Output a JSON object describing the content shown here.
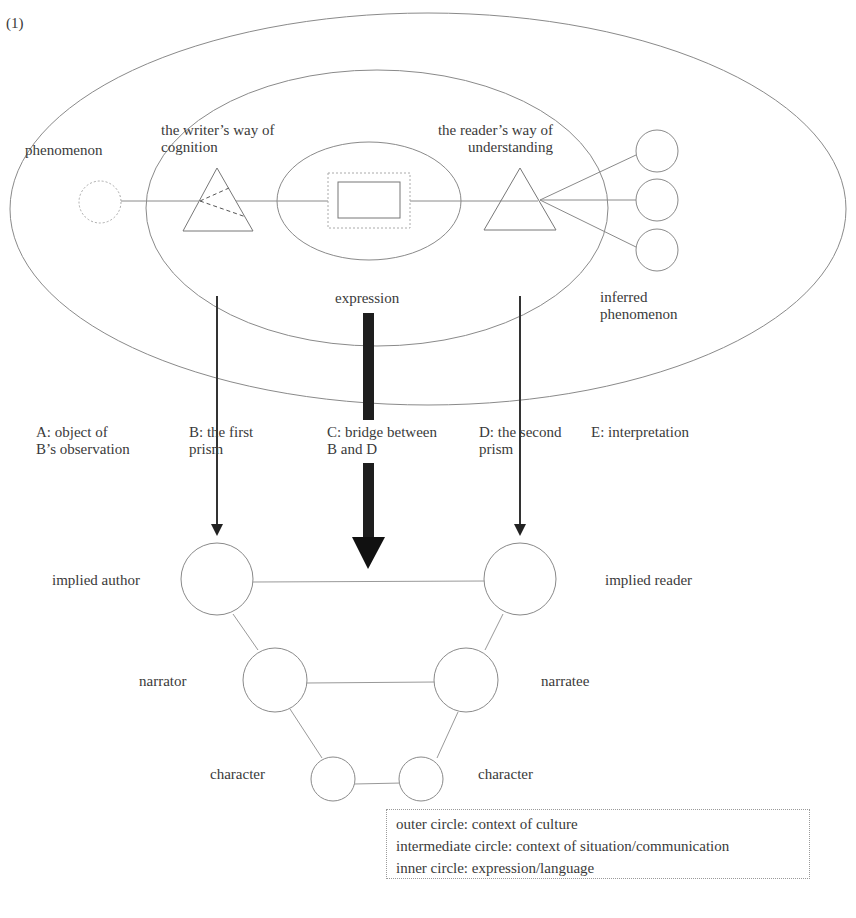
{
  "figure": {
    "number_label": "(1)",
    "top_diagram": {
      "labels": {
        "phenomenon": "phenomenon",
        "writer_way": [
          "the writer’s way of",
          "cognition"
        ],
        "reader_way": [
          "the reader’s way of",
          "understanding"
        ],
        "expression": "expression",
        "inferred": [
          "inferred",
          "phenomenon"
        ]
      },
      "shapes": {
        "outer_circle": "context of culture",
        "intermediate_circle": "context of situation/communication",
        "inner_circle": "expression/language",
        "phenomenon_circle": "dotted",
        "writer_prism": "triangle with dashed refraction lines",
        "reader_prism": "triangle",
        "inferred_phenomena_count": 3
      }
    },
    "roles": [
      {
        "id": "A",
        "lines": [
          "A: object of",
          "B’s observation"
        ]
      },
      {
        "id": "B",
        "lines": [
          "B: the first",
          "prism"
        ]
      },
      {
        "id": "C",
        "lines": [
          "C: bridge between",
          "B and D"
        ]
      },
      {
        "id": "D",
        "lines": [
          "D: the second",
          "prism"
        ]
      },
      {
        "id": "E",
        "lines": [
          "E: interpretation"
        ]
      }
    ],
    "bottom_diagram": {
      "left": [
        "implied author",
        "narrator",
        "character"
      ],
      "right": [
        "implied reader",
        "narratee",
        "character"
      ]
    },
    "legend": [
      "outer circle: context of culture",
      "intermediate circle: context of situation/communication",
      "inner circle: expression/language"
    ]
  }
}
